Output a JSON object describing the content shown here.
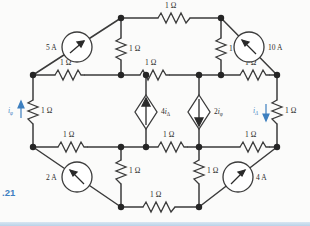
{
  "figure": {
    "caption": ".21"
  },
  "units": {
    "ohm": "1 Ω"
  },
  "resistors": [
    {
      "id": "r-top-mid",
      "label": "1 Ω",
      "orientation": "horizontal"
    },
    {
      "id": "r-upper-vert-left",
      "label": "1 Ω",
      "orientation": "vertical"
    },
    {
      "id": "r-upper-vert-right",
      "label": "1 Ω",
      "orientation": "vertical"
    },
    {
      "id": "r-row1-left",
      "label": "1 Ω",
      "orientation": "horizontal"
    },
    {
      "id": "r-row1-mid",
      "label": "1 Ω",
      "orientation": "horizontal"
    },
    {
      "id": "r-row1-right",
      "label": "1 Ω",
      "orientation": "horizontal"
    },
    {
      "id": "r-left-side",
      "label": "1 Ω",
      "orientation": "vertical"
    },
    {
      "id": "r-right-side",
      "label": "1 Ω",
      "orientation": "vertical"
    },
    {
      "id": "r-row2-left",
      "label": "1 Ω",
      "orientation": "horizontal"
    },
    {
      "id": "r-row2-mid",
      "label": "1 Ω",
      "orientation": "horizontal"
    },
    {
      "id": "r-row2-right",
      "label": "1 Ω",
      "orientation": "horizontal"
    },
    {
      "id": "r-lower-vert-left",
      "label": "1 Ω",
      "orientation": "vertical"
    },
    {
      "id": "r-lower-vert-right",
      "label": "1 Ω",
      "orientation": "vertical"
    },
    {
      "id": "r-bottom-mid",
      "label": "1 Ω",
      "orientation": "horizontal"
    }
  ],
  "sources": {
    "independent": [
      {
        "id": "src-5a",
        "label": "5 A",
        "shape": "circle",
        "arrow_direction": "up-right",
        "label_side": "left"
      },
      {
        "id": "src-10a",
        "label": "10 A",
        "shape": "circle",
        "arrow_direction": "up-left",
        "label_side": "right"
      },
      {
        "id": "src-2a",
        "label": "2 A",
        "shape": "circle",
        "arrow_direction": "up-left",
        "label_side": "left"
      },
      {
        "id": "src-4a",
        "label": "4 A",
        "shape": "circle",
        "arrow_direction": "up-right",
        "label_side": "right"
      }
    ],
    "dependent": [
      {
        "id": "dep-4idelta",
        "coefficient": "4",
        "variable": "i",
        "subscript": "Δ",
        "label": "4iΔ",
        "shape": "diamond",
        "arrow_direction": "up",
        "label_side": "right"
      },
      {
        "id": "dep-2iphi",
        "coefficient": "2",
        "variable": "i",
        "subscript": "φ",
        "label": "2iφ",
        "shape": "diamond",
        "arrow_direction": "down",
        "label_side": "right"
      }
    ]
  },
  "current_labels": [
    {
      "id": "i-phi",
      "variable": "i",
      "subscript": "φ",
      "label": "iφ",
      "color": "#4a86c5",
      "arrow_direction": "up",
      "position": "left-side-resistor"
    },
    {
      "id": "i-delta",
      "variable": "i",
      "subscript": "Δ",
      "label": "iΔ",
      "color": "#4a86c5",
      "arrow_direction": "down",
      "position": "right-side-resistor"
    }
  ],
  "colors": {
    "wire": "#3b3b3b",
    "node": "#252525",
    "accent_blue": "#4a86c5",
    "background": "#fbfbfa"
  }
}
